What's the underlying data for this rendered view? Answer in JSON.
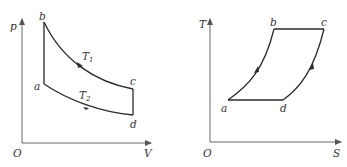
{
  "diagrams": [
    {
      "name": "p-V diagram",
      "axes": {
        "y_label": "p",
        "x_label": "V",
        "origin_label": "O"
      },
      "points": {
        "a": "a",
        "b": "b",
        "c": "c",
        "d": "d"
      },
      "isotherms": {
        "upper": {
          "symbol": "T",
          "subscript": "1"
        },
        "lower": {
          "symbol": "T",
          "subscript": "2"
        }
      },
      "process_path": [
        "a→b vertical (isochoric)",
        "b→c curve T1 (isothermal)",
        "c→d vertical (isochoric)",
        "d→a curve T2 (isothermal)"
      ]
    },
    {
      "name": "T-S diagram",
      "axes": {
        "y_label": "T",
        "x_label": "S",
        "origin_label": "O"
      },
      "points": {
        "a": "a",
        "b": "b",
        "c": "c",
        "d": "d"
      },
      "process_path": [
        "a→b curve",
        "b→c horizontal",
        "c→d curve",
        "d→a horizontal"
      ]
    }
  ],
  "colors": {
    "line": "#2a2a2a",
    "axis": "#555555",
    "text": "#333333",
    "background": "#ffffff"
  }
}
